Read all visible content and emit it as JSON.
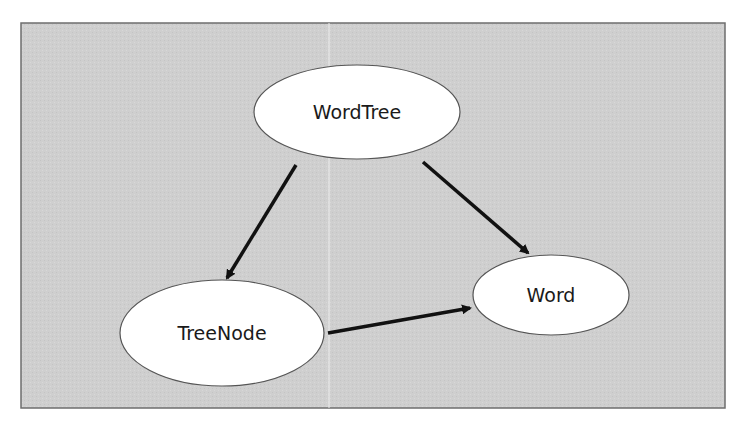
{
  "diagram": {
    "type": "class-dependency-graph",
    "colors": {
      "panel_background": "#cfcfcf",
      "panel_border": "#6e6e6e",
      "node_fill": "#ffffff",
      "node_stroke": "#555555",
      "edge": "#111111"
    },
    "nodes": [
      {
        "id": "wordtree",
        "label": "WordTree",
        "cx": 357,
        "cy": 112,
        "rx": 103,
        "ry": 47
      },
      {
        "id": "treenode",
        "label": "TreeNode",
        "cx": 222,
        "cy": 333,
        "rx": 102,
        "ry": 53
      },
      {
        "id": "word",
        "label": "Word",
        "cx": 551,
        "cy": 295,
        "rx": 78,
        "ry": 40
      }
    ],
    "edges": [
      {
        "from": "WordTree",
        "to": "TreeNode"
      },
      {
        "from": "WordTree",
        "to": "Word"
      },
      {
        "from": "TreeNode",
        "to": "Word"
      }
    ]
  }
}
